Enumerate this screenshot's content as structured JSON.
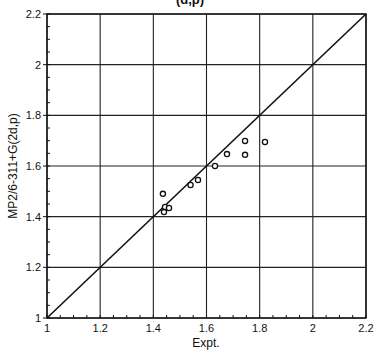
{
  "chart_data": {
    "type": "scatter",
    "title": "(d,p)",
    "xlabel": "Expt.",
    "ylabel": "MP2/6-311+G(2d,p)",
    "xlim": [
      1,
      2.2
    ],
    "ylim": [
      1,
      2.2
    ],
    "grid": true,
    "x_ticks": [
      "1",
      "1.2",
      "1.4",
      "1.6",
      "1.8",
      "2",
      "2.2"
    ],
    "y_ticks": [
      "1",
      "1.2",
      "1.4",
      "1.6",
      "1.8",
      "2",
      "2.2"
    ],
    "reference_line": {
      "label": "y = x",
      "from": [
        1,
        1
      ],
      "to": [
        2.2,
        2.2
      ]
    },
    "series": [
      {
        "name": "data",
        "marker": "open-circle",
        "points": [
          [
            1.436,
            1.49
          ],
          [
            1.444,
            1.438
          ],
          [
            1.459,
            1.434
          ],
          [
            1.44,
            1.418
          ],
          [
            1.54,
            1.525
          ],
          [
            1.568,
            1.545
          ],
          [
            1.632,
            1.6
          ],
          [
            1.677,
            1.647
          ],
          [
            1.745,
            1.699
          ],
          [
            1.745,
            1.644
          ],
          [
            1.82,
            1.695
          ]
        ]
      }
    ]
  }
}
